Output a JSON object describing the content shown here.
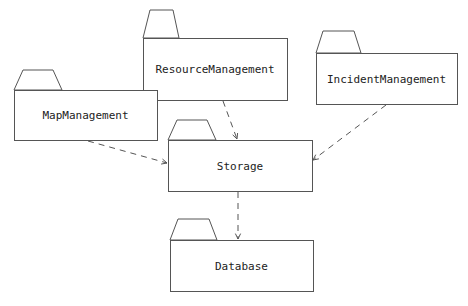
{
  "diagram": {
    "type": "UML package diagram",
    "packages": [
      {
        "id": "resource",
        "label": "ResourceManagement",
        "box": [
          143,
          38,
          144,
          62
        ],
        "tab": [
          [
            143,
            38
          ],
          [
            150,
            10
          ],
          [
            173,
            10
          ],
          [
            179,
            38
          ]
        ]
      },
      {
        "id": "incident",
        "label": "IncidentManagement",
        "box": [
          316,
          53,
          141,
          51
        ],
        "tab": [
          [
            316,
            53
          ],
          [
            323,
            31
          ],
          [
            354,
            31
          ],
          [
            361,
            53
          ]
        ]
      },
      {
        "id": "map",
        "label": "MapManagement",
        "box": [
          14,
          90,
          143,
          50
        ],
        "tab": [
          [
            14,
            90
          ],
          [
            23,
            70
          ],
          [
            53,
            70
          ],
          [
            62,
            90
          ]
        ]
      },
      {
        "id": "storage",
        "label": "Storage",
        "box": [
          168,
          140,
          144,
          51
        ],
        "tab": [
          [
            168,
            140
          ],
          [
            177,
            120
          ],
          [
            207,
            120
          ],
          [
            216,
            140
          ]
        ]
      },
      {
        "id": "database",
        "label": "Database",
        "box": [
          170,
          240,
          143,
          51
        ],
        "tab": [
          [
            170,
            240
          ],
          [
            178,
            219
          ],
          [
            209,
            219
          ],
          [
            217,
            240
          ]
        ]
      }
    ],
    "dependencies": [
      {
        "from": "resource",
        "to": "storage",
        "line": [
          [
            223,
            101
          ],
          [
            237,
            139
          ]
        ]
      },
      {
        "from": "incident",
        "to": "storage",
        "line": [
          [
            386,
            105
          ],
          [
            313,
            160
          ]
        ]
      },
      {
        "from": "map",
        "to": "storage",
        "line": [
          [
            88,
            141
          ],
          [
            167,
            163
          ]
        ]
      },
      {
        "from": "storage",
        "to": "database",
        "line": [
          [
            238,
            192
          ],
          [
            238,
            239
          ]
        ]
      }
    ]
  }
}
